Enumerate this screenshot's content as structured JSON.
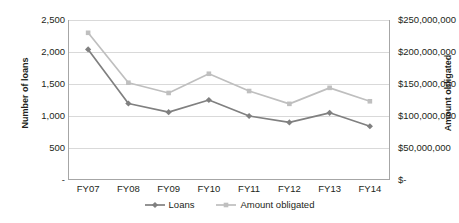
{
  "chart_data": {
    "type": "line",
    "title": "",
    "subtitle": "",
    "xlabel": "",
    "ylabel": "Number of loans",
    "y2label": "Amount obligated",
    "categories": [
      "FY07",
      "FY08",
      "FY09",
      "FY10",
      "FY11",
      "FY12",
      "FY13",
      "FY14"
    ],
    "grid": true,
    "legend_position": "bottom",
    "ylim": [
      0,
      2500
    ],
    "y2lim": [
      0,
      250000000
    ],
    "yticks": [
      0,
      500,
      1000,
      1500,
      2000,
      2500
    ],
    "ytick_labels": [
      "-",
      "500",
      "1,000",
      "1,500",
      "2,000",
      "2,500"
    ],
    "y2ticks": [
      0,
      50000000,
      100000000,
      150000000,
      200000000,
      250000000
    ],
    "y2tick_labels": [
      "$-",
      "$50,000,000",
      "$100,000,000",
      "$150,000,000",
      "$200,000,000",
      "$250,000,000"
    ],
    "series": [
      {
        "name": "Loans",
        "axis": "left",
        "color": "#808080",
        "marker": "diamond",
        "values": [
          2040,
          1195,
          1060,
          1250,
          1000,
          900,
          1050,
          840
        ]
      },
      {
        "name": "Amount obligated",
        "axis": "right",
        "color": "#bfbfbf",
        "marker": "square",
        "values": [
          230000000,
          152000000,
          136000000,
          166000000,
          139000000,
          119000000,
          144000000,
          123000000
        ]
      }
    ]
  },
  "legend": {
    "items": [
      {
        "label": "Loans",
        "color": "#808080",
        "marker": "diamond"
      },
      {
        "label": "Amount obligated",
        "color": "#bfbfbf",
        "marker": "square"
      }
    ]
  },
  "colors": {
    "loans": "#808080",
    "amount_obligated": "#bfbfbf",
    "grid": "#d9d9d9",
    "axis": "#a6a6a6",
    "text": "#231f20",
    "background": "#ffffff"
  }
}
